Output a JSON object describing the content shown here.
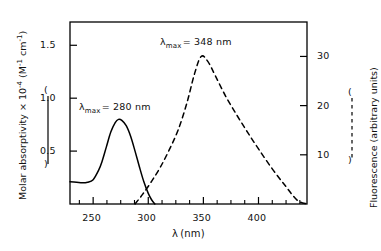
{
  "chart_data": {
    "type": "line",
    "title": "",
    "xlabel": "λ (nm)",
    "xlim": [
      229,
      444
    ],
    "x_ticks": [
      250,
      300,
      350,
      400
    ],
    "x_minor_ticks": [
      237.5,
      262.5,
      275,
      287.5,
      312.5,
      325,
      337.5,
      362.5,
      375,
      387.5,
      412.5,
      425,
      437.5
    ],
    "grid": false,
    "legend_position": "axis-titles",
    "axes": [
      {
        "side": "left",
        "label": "Molar absorptivity × 10⁻⁴ (M⁻¹ cm⁻¹)",
        "label_parts": {
          "text_1": "Molar absorptivity × 10",
          "exp_1": "-4",
          "text_2": " (M",
          "exp_2": "-1",
          "text_3": " cm",
          "exp_3": "-1",
          "text_4": ")"
        },
        "ticks": [
          0.5,
          1.0,
          1.5
        ],
        "tick_labels": [
          "0.5",
          "1.0",
          "1.5"
        ],
        "ylim": [
          0,
          1.72
        ],
        "marker": "solid-line"
      },
      {
        "side": "right",
        "label": "Fluorescence (arbitrary units)",
        "ticks": [
          10,
          20,
          30
        ],
        "tick_labels": [
          "10",
          "20",
          "30"
        ],
        "ylim": [
          0,
          37
        ],
        "marker": "dashed-line"
      }
    ],
    "series": [
      {
        "name": "Absorption spectrum",
        "axis": "left",
        "style": "solid",
        "color": "#000000",
        "lambda_max": 280,
        "peak_value": 0.8,
        "annotation": "λ max = 280 nm",
        "x": [
          229,
          235,
          240,
          245,
          250,
          255,
          258,
          262,
          266,
          270,
          273,
          276,
          280,
          284,
          288,
          292,
          296,
          300,
          303,
          306
        ],
        "y": [
          0.21,
          0.205,
          0.2,
          0.205,
          0.23,
          0.32,
          0.4,
          0.54,
          0.68,
          0.77,
          0.8,
          0.79,
          0.74,
          0.64,
          0.5,
          0.35,
          0.21,
          0.1,
          0.04,
          0.0
        ]
      },
      {
        "name": "Fluorescence emission spectrum",
        "axis": "right",
        "style": "dashed",
        "color": "#000000",
        "lambda_max": 348,
        "peak_value": 30,
        "annotation": "λ max = 348 nm",
        "x": [
          288,
          295,
          303,
          311,
          319,
          327,
          335,
          342,
          348,
          354,
          361,
          370,
          380,
          390,
          400,
          412,
          424,
          435,
          444
        ],
        "y": [
          0,
          2.0,
          4.6,
          7.5,
          11.0,
          15.0,
          20.5,
          26.5,
          30.0,
          29.0,
          26.0,
          22.0,
          18.2,
          14.6,
          11.2,
          7.3,
          3.8,
          0.8,
          0.0
        ]
      }
    ],
    "annotations": [
      {
        "name": "lambda-max-348",
        "lam": "λ",
        "sub": "max",
        "rest": "= 348 nm",
        "x_px": 160,
        "y_px": 36
      },
      {
        "name": "lambda-max-280",
        "lam": "λ",
        "sub": "max",
        "rest": "= 280 nm",
        "x_px": 79,
        "y_px": 101
      }
    ]
  },
  "axis_titles": {
    "x": {
      "lam": "λ",
      "unit": "(nm)"
    },
    "left_legend_paren_open": "(",
    "left_legend_paren_close": ")",
    "right_legend_paren_open": "(",
    "right_legend_paren_close": ")"
  },
  "tick_text": {
    "x": [
      "250",
      "300",
      "350",
      "400"
    ],
    "left": [
      "1.5",
      "1.0",
      "0.5"
    ],
    "right": [
      "30",
      "20",
      "10"
    ]
  },
  "colors": {
    "line": "#000000",
    "background": "#ffffff",
    "text": "#111111"
  }
}
